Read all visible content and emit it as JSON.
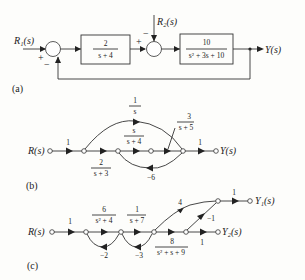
{
  "figure_a": {
    "caption": "(a)",
    "input1": "R₁(s)",
    "input2": "R₂(s)",
    "output": "Y(s)",
    "block1": {
      "num": "2",
      "den": "s + 4"
    },
    "block2": {
      "num": "10",
      "den": "s² + 3s + 10"
    },
    "sum1_signs": {
      "input": "+",
      "feedback": "−"
    },
    "sum2_signs": {
      "left": "+",
      "top": "−"
    }
  },
  "figure_b": {
    "caption": "(b)",
    "input": "R(s)",
    "output": "Y(s)",
    "gains": {
      "in": "1",
      "g1": {
        "num": "2",
        "den": "s + 3"
      },
      "top": {
        "num": "1",
        "den": "s"
      },
      "mid": {
        "num": "s",
        "den": "s + 4"
      },
      "g3": {
        "num": "3",
        "den": "s + 5"
      },
      "feedback": "−6",
      "out": "1"
    }
  },
  "figure_c": {
    "caption": "(c)",
    "input": "R(s)",
    "output1": "Y₁(s)",
    "output2": "Y₂(s)",
    "gains": {
      "in": "1",
      "g1": {
        "num": "6",
        "den": "s² + 4"
      },
      "g2": {
        "num": "1",
        "den": "s + 7"
      },
      "g3": {
        "num": "8",
        "den": "s² + s + 9"
      },
      "fb1": "−2",
      "fb2": "−3",
      "up": "4",
      "cross": "−1",
      "out1": "1",
      "out2": "1"
    }
  }
}
